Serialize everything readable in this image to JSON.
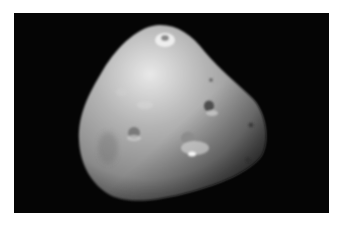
{
  "image": {
    "subject": "moon",
    "description": "Irregular, potato-shaped cratered moon lit from upper-left against black space",
    "background_color": "#050505",
    "border_color": "#ffffff",
    "surface_color_light": "#e6e6e6",
    "surface_color_mid": "#9a9a9a",
    "surface_color_dark": "#3a3a3a"
  }
}
